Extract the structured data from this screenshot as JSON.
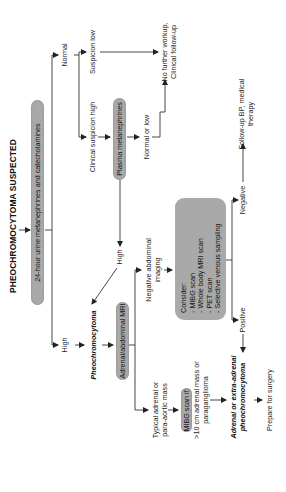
{
  "diagram": {
    "title": "PHEOCHROMOCYTOMA SUSPECTED",
    "nodes": {
      "urine_test": "24-hour urine metanephrines and catecholamines",
      "normal_branch": "Normal",
      "high_branch": "High",
      "suspicion_low": "Suspicion low",
      "clinical_suspicion_high": "Clinical suspicion high",
      "plasma_test": "Plasma metanephrines",
      "normal_or_low": "Normal or low",
      "no_further_workup_line1": "No further workup,",
      "no_further_workup_line2": "Clinical follow-up",
      "plasma_high": "High",
      "pheochromocytoma": "Pheochromocytoma",
      "mri": "Adrenal/abdominal MRI",
      "negative_imaging_line1": "Negative abdominal",
      "negative_imaging_line2": "imaging",
      "consider_title": "Consider:",
      "consider_items": [
        "- MIBG scan",
        "- Whole body MRI scan",
        "- PET scan",
        "- Selective venous sampling"
      ],
      "positive": "Positive",
      "negative": "Negative",
      "typical_mass_line1": "Typical adrenal or",
      "typical_mass_line2": "para-aortic mass",
      "mibg_if": "MIBG scan if:",
      "mibg_criteria_line1": ">10 cm adrenal mass or",
      "mibg_criteria_line2": "paraganglioma",
      "adrenal_extra_line1": "Adrenal or extra-adrenal",
      "adrenal_extra_line2": "pheochromocytoma",
      "prepare_surgery": "Prepare for surgery",
      "follow_up_line1": "Follow-up BP, medical",
      "follow_up_line2": "therapy"
    },
    "colors": {
      "node_fill": "#a9a9a9",
      "line": "#333333",
      "text": "#1a1a1a"
    }
  }
}
